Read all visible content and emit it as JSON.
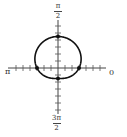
{
  "diagram": {
    "axis_labels": {
      "top": {
        "numerator": "π",
        "denominator": "2"
      },
      "bottom": {
        "numerator": "3π",
        "denominator": "2"
      },
      "left": "π",
      "right": "0"
    },
    "curve": {
      "equation_form": "r = 2 + sin θ",
      "key_points": [
        {
          "theta": "0",
          "r": 2
        },
        {
          "theta": "π/2",
          "r": 3
        },
        {
          "theta": "π",
          "r": 2
        },
        {
          "theta": "3π/2",
          "r": 1
        }
      ]
    },
    "colors": {
      "curve": "#111111",
      "axis": "#444444",
      "background": "#ffffff"
    }
  }
}
